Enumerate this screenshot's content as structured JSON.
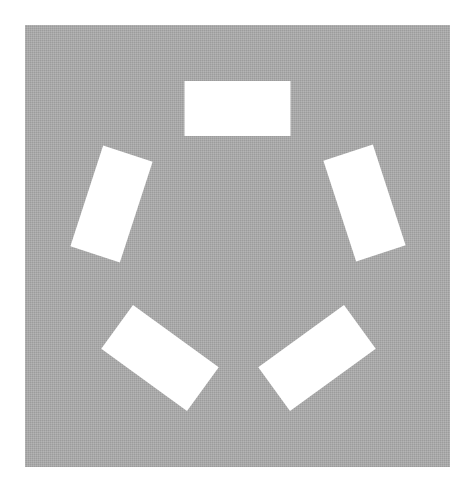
{
  "canvas": {
    "width": 476,
    "height": 494,
    "background": "#ffffff"
  },
  "panel": {
    "x": 25,
    "y": 25,
    "width": 425,
    "height": 442,
    "fill": "#a9a9a9"
  },
  "arrangement": {
    "type": "pentagon",
    "center": [
      237.5,
      250
    ],
    "radius": 142
  },
  "rectangles": [
    {
      "name": "rect-top",
      "cx": 237.5,
      "cy": 108.5,
      "width": 106,
      "height": 55,
      "rotation": 0,
      "fill": "#ffffff"
    },
    {
      "name": "rect-right",
      "cx": 364.5,
      "cy": 203,
      "width": 106,
      "height": 52,
      "rotation": 72,
      "fill": "#ffffff"
    },
    {
      "name": "rect-bottom-right",
      "cx": 317,
      "cy": 358,
      "width": 106,
      "height": 54,
      "rotation": -36,
      "fill": "#ffffff"
    },
    {
      "name": "rect-bottom-left",
      "cx": 160,
      "cy": 358,
      "width": 106,
      "height": 54,
      "rotation": 36,
      "fill": "#ffffff"
    },
    {
      "name": "rect-left",
      "cx": 111.5,
      "cy": 204,
      "width": 106,
      "height": 52,
      "rotation": -72,
      "fill": "#ffffff"
    }
  ]
}
